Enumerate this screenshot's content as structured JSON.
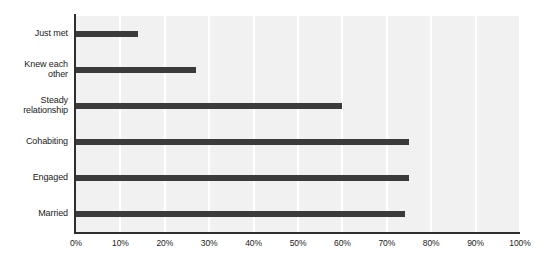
{
  "chart_data": {
    "type": "bar",
    "orientation": "horizontal",
    "title": "",
    "subtitle": "",
    "xlabel": "",
    "ylabel": "",
    "categories": [
      "Just met",
      "Knew each other",
      "Steady relationship",
      "Cohabiting",
      "Engaged",
      "Married"
    ],
    "category_lines": [
      [
        "Just met"
      ],
      [
        "Knew each",
        "other"
      ],
      [
        "Steady",
        "relationship"
      ],
      [
        "Cohabiting"
      ],
      [
        "Engaged"
      ],
      [
        "Married"
      ]
    ],
    "values": [
      14,
      27,
      60,
      75,
      75,
      74
    ],
    "value_unit": "%",
    "xlim": [
      0,
      100
    ],
    "xticks": [
      0,
      10,
      20,
      30,
      40,
      50,
      60,
      70,
      80,
      90,
      100
    ],
    "xticklabels": [
      "0%",
      "10%",
      "20%",
      "30%",
      "40%",
      "50%",
      "60%",
      "70%",
      "80%",
      "90%",
      "100%"
    ],
    "grid": "vertical",
    "legend": "none",
    "colors": {
      "bar": "#3b3b3b",
      "plot_background": "#f1f1f1",
      "gridline": "#ffffff",
      "axis": "#2f2f2f",
      "text": "#1b1b1b",
      "figure_background": "#ffffff"
    }
  }
}
